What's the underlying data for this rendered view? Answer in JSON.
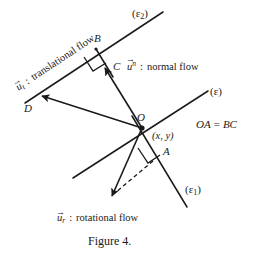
{
  "figure": {
    "caption": "Figure 4.",
    "lines": {
      "epsilon": {
        "name": "(ε)",
        "base": "(ε)",
        "sub": ""
      },
      "epsilon1": {
        "name": "(ε₁)",
        "base": "(ε",
        "sub": "1",
        "close": ")"
      },
      "epsilon2": {
        "name": "(ε₂)",
        "base": "(ε",
        "sub": "2",
        "close": ")"
      }
    },
    "points": {
      "O": "O",
      "A": "A",
      "B": "B",
      "C": "C",
      "D": "D"
    },
    "coordinate_label": "(x, y)",
    "relation": {
      "left": "OA",
      "op": "=",
      "right": "BC"
    },
    "annotations": {
      "translational": {
        "symbol": "u",
        "sub": "t",
        "sup": "",
        "separator": ":",
        "text": "translational flow"
      },
      "normal": {
        "symbol": "u",
        "sub": "",
        "sup": "n",
        "separator": ":",
        "text": "normal flow"
      },
      "rotational": {
        "symbol": "u",
        "sub": "r",
        "sup": "",
        "separator": ":",
        "text": "rotational flow"
      }
    },
    "colors": {
      "ink": "#1a1a1a",
      "background": "#ffffff"
    }
  }
}
